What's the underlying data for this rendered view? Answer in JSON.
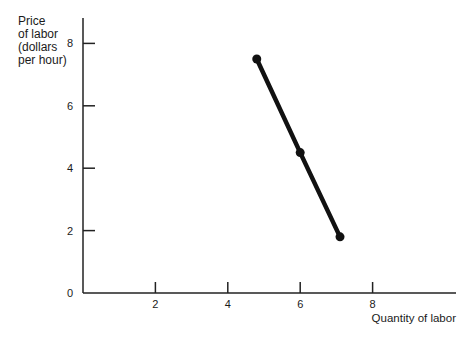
{
  "chart_data": {
    "type": "line",
    "title": "",
    "xlabel": "Quantity of labor",
    "ylabel_lines": [
      "Price",
      "of labor",
      "(dollars",
      "per hour)"
    ],
    "ylabel": "Price of labor (dollars per hour)",
    "xlim": [
      0,
      10.5
    ],
    "ylim": [
      0,
      8.8
    ],
    "x_ticks": [
      2,
      4,
      6,
      8
    ],
    "x_tick_labels": [
      "2",
      "4",
      "6",
      "8"
    ],
    "y_ticks": [
      0,
      2,
      4,
      6,
      8
    ],
    "y_tick_labels": [
      "0",
      "2",
      "4",
      "6",
      "8"
    ],
    "grid": false,
    "legend": "none",
    "series": [
      {
        "name": "Labor demand",
        "color": "#111111",
        "markers": true,
        "points": [
          {
            "x": 4.8,
            "y": 7.5
          },
          {
            "x": 6.0,
            "y": 4.5
          },
          {
            "x": 7.1,
            "y": 1.8
          }
        ]
      }
    ]
  }
}
